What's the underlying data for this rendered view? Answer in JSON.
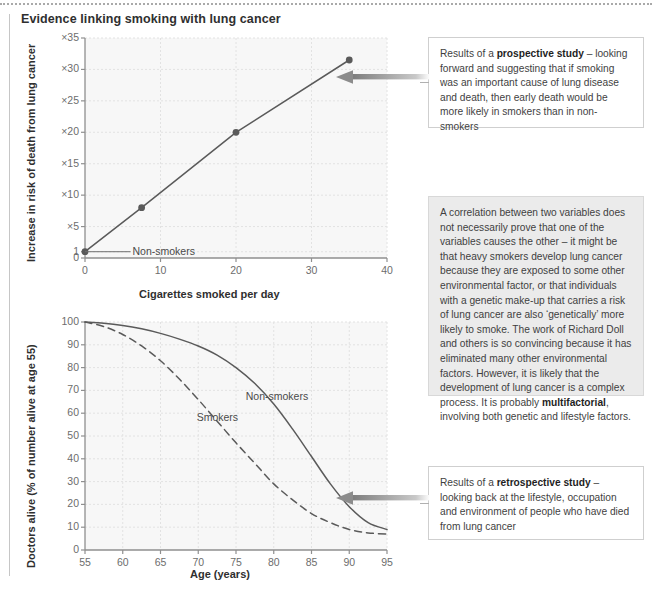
{
  "page": {
    "title": "Evidence linking smoking with lung cancer"
  },
  "chart_data": [
    {
      "id": "risk-vs-cigarettes",
      "type": "line",
      "title": "",
      "xlabel": "Cigarettes smoked per day",
      "ylabel": "Increase in risk of death from lung cancer",
      "xlim": [
        0,
        40
      ],
      "ylim": [
        0,
        35
      ],
      "xticks": [
        "0",
        "10",
        "20",
        "30",
        "40"
      ],
      "xtick_values": [
        0,
        10,
        20,
        30,
        40
      ],
      "yticks": [
        "0",
        "1",
        "×5",
        "×10",
        "×15",
        "×20",
        "×25",
        "×30",
        "×35"
      ],
      "ytick_values": [
        0,
        1,
        5,
        10,
        15,
        20,
        25,
        30,
        35
      ],
      "grid": true,
      "legend": "none",
      "annotations": [
        {
          "text": "Non-smokers",
          "x": 5.5,
          "y": 1
        }
      ],
      "series": [
        {
          "name": "Increase in risk of death",
          "marker": "circle",
          "x": [
            0,
            7.5,
            20,
            35
          ],
          "y": [
            1,
            8,
            20,
            31.5
          ]
        }
      ]
    },
    {
      "id": "doctors-alive-vs-age",
      "type": "line",
      "title": "",
      "xlabel": "Age (years)",
      "ylabel": "Doctors alive (% of number alive at age 55)",
      "xlim": [
        55,
        95
      ],
      "ylim": [
        0,
        100
      ],
      "xticks": [
        "55",
        "60",
        "65",
        "70",
        "75",
        "80",
        "85",
        "90",
        "95"
      ],
      "xtick_values": [
        55,
        60,
        65,
        70,
        75,
        80,
        85,
        90,
        95
      ],
      "yticks": [
        "0",
        "10",
        "20",
        "30",
        "40",
        "50",
        "60",
        "70",
        "80",
        "90",
        "100"
      ],
      "ytick_values": [
        0,
        10,
        20,
        30,
        40,
        50,
        60,
        70,
        80,
        90,
        100
      ],
      "grid": true,
      "legend": "inline",
      "series": [
        {
          "name": "Non-smokers",
          "style": "solid",
          "label_x": 80.0,
          "label_y": 67,
          "x": [
            55,
            57.5,
            60,
            62.5,
            65,
            67.5,
            70,
            72.5,
            75,
            77.5,
            80,
            82.5,
            85,
            87.5,
            90,
            92.5,
            95
          ],
          "y": [
            100,
            99.5,
            98.5,
            97,
            95,
            92.5,
            89.5,
            85.5,
            80,
            73,
            64,
            53,
            41,
            29,
            19,
            12,
            9
          ]
        },
        {
          "name": "Smokers",
          "style": "dashed",
          "label_x": 73.5,
          "label_y": 58,
          "x": [
            55,
            57.5,
            60,
            62.5,
            65,
            67.5,
            70,
            72.5,
            75,
            77.5,
            80,
            82.5,
            85,
            87.5,
            90,
            92.5,
            95
          ],
          "y": [
            100,
            98,
            94.5,
            89.5,
            83,
            75,
            66,
            56.5,
            47,
            38,
            29,
            22,
            16,
            12,
            9,
            7.5,
            7
          ]
        }
      ]
    }
  ],
  "callouts": [
    {
      "id": "prospective",
      "style": "plain",
      "lines": [
        {
          "text": "Results of a ",
          "bold": false
        },
        {
          "text": "prospective study",
          "bold": true
        },
        {
          "text": " – looking forward and suggesting that if smoking was an important cause of lung disease and death, then early death would be more likely in smokers than in non-smokers",
          "bold": false
        }
      ],
      "plain_text": "Results of a prospective study – looking forward and suggesting that if smoking was an important cause of lung disease and death, then early death would be more likely in smokers than in non-smokers"
    },
    {
      "id": "correlation",
      "style": "shaded",
      "lines": [
        {
          "text": "A correlation between two variables does not necessarily prove that one of the variables causes the other – it might be that heavy smokers develop lung cancer because they are exposed to some other environmental factor, or that individuals with a genetic make-up that carries a risk of lung cancer are also ‘genetically’ more likely to smoke. The work of Richard Doll and others is so convincing because it has eliminated many other environmental factors. However, it is likely that the development of lung cancer is a complex process. It is probably ",
          "bold": false
        },
        {
          "text": "multifactorial",
          "bold": true
        },
        {
          "text": ", involving both genetic and lifestyle factors.",
          "bold": false
        }
      ],
      "plain_text": "A correlation between two variables does not necessarily prove that one of the variables causes the other – it might be that heavy smokers develop lung cancer because they are exposed to some other environmental factor, or that individuals with a genetic make-up that carries a risk of lung cancer are also ‘genetically’ more likely to smoke. The work of Richard Doll and others is so convincing because it has eliminated many other environmental factors. However, it is likely that the development of lung cancer is a complex process. It is probably multifactorial, involving both genetic and lifestyle factors."
    },
    {
      "id": "retrospective",
      "style": "plain",
      "lines": [
        {
          "text": "Results of a ",
          "bold": false
        },
        {
          "text": "retrospective study",
          "bold": true
        },
        {
          "text": " – looking back at the lifestyle, occupation and environment of people who have died from lung cancer",
          "bold": false
        }
      ],
      "plain_text": "Results of a retrospective study – looking back at the lifestyle, occupation and environment of people who have died from lung cancer"
    }
  ],
  "colors": {
    "plot_bg": "#f7f7f7",
    "grid": "#e2e2e2",
    "axis": "#8f8f8f",
    "series": "#5a5a5a",
    "text": "#3a3a3a",
    "callout_shaded_bg": "#ebebeb",
    "arrow": "#8c8c8c"
  }
}
